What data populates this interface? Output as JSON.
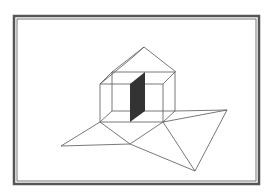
{
  "figure": {
    "colors": {
      "background": "#ffffff",
      "frame": "#555555",
      "line": "#555555",
      "panel": "#333333"
    },
    "frame": {
      "outer": [
        14,
        16,
        259,
        184
      ],
      "inner": [
        17,
        19,
        256,
        181
      ]
    },
    "lines": [
      [
        144,
        47,
        176,
        72
      ],
      [
        144,
        47,
        112,
        72
      ],
      [
        133,
        57,
        100,
        84
      ],
      [
        144,
        47,
        133,
        57
      ],
      [
        100,
        84,
        163,
        84
      ],
      [
        163,
        84,
        163,
        122
      ],
      [
        163,
        122,
        100,
        122
      ],
      [
        100,
        122,
        100,
        84
      ],
      [
        112,
        72,
        175,
        72
      ],
      [
        175,
        72,
        175,
        111
      ],
      [
        175,
        111,
        112,
        111
      ],
      [
        112,
        111,
        112,
        72
      ],
      [
        100,
        84,
        112,
        72
      ],
      [
        163,
        84,
        175,
        72
      ],
      [
        163,
        122,
        175,
        111
      ],
      [
        100,
        122,
        112,
        111
      ],
      [
        100,
        122,
        61,
        146
      ],
      [
        100,
        122,
        130,
        144
      ],
      [
        61,
        146,
        130,
        144
      ],
      [
        130,
        144,
        163,
        122
      ],
      [
        130,
        144,
        195,
        171
      ],
      [
        163,
        122,
        195,
        171
      ],
      [
        163,
        122,
        227,
        110
      ],
      [
        175,
        111,
        227,
        110
      ],
      [
        227,
        110,
        195,
        171
      ]
    ],
    "panel": [
      [
        130,
        84
      ],
      [
        145,
        72
      ],
      [
        145,
        111
      ],
      [
        130,
        122
      ]
    ]
  }
}
